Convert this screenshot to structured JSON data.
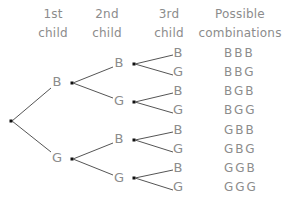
{
  "headers": [
    {
      "line1": "1st",
      "line2": "child",
      "cx": 53
    },
    {
      "line1": "2nd",
      "line2": "child",
      "cx": 107
    },
    {
      "line1": "3rd",
      "line2": "child",
      "cx": 169
    },
    {
      "line1": "Possible",
      "line2": "combinations",
      "cx": 240
    }
  ],
  "colors": {
    "line": "#555555",
    "text": "#8c8c8c",
    "dot": "#111111"
  },
  "root": {
    "x": 11,
    "y": 121
  },
  "level1": [
    {
      "label": "B",
      "lx": 57,
      "ly": 82,
      "dot": {
        "x": 72,
        "y": 83
      }
    },
    {
      "label": "G",
      "lx": 57,
      "ly": 158,
      "dot": {
        "x": 72,
        "y": 159
      }
    }
  ],
  "level2": [
    {
      "label": "B",
      "lx": 119,
      "ly": 63,
      "dot": {
        "x": 134,
        "y": 64
      },
      "parent": 0
    },
    {
      "label": "G",
      "lx": 119,
      "ly": 101,
      "dot": {
        "x": 134,
        "y": 102
      },
      "parent": 0
    },
    {
      "label": "B",
      "lx": 119,
      "ly": 139,
      "dot": {
        "x": 134,
        "y": 140
      },
      "parent": 1
    },
    {
      "label": "G",
      "lx": 119,
      "ly": 178,
      "dot": {
        "x": 134,
        "y": 178
      },
      "parent": 1
    }
  ],
  "level3": [
    {
      "label": "B",
      "lx": 178,
      "ly": 53,
      "parent": 0
    },
    {
      "label": "G",
      "lx": 178,
      "ly": 72,
      "parent": 0
    },
    {
      "label": "B",
      "lx": 178,
      "ly": 91,
      "parent": 1
    },
    {
      "label": "G",
      "lx": 178,
      "ly": 110,
      "parent": 1
    },
    {
      "label": "B",
      "lx": 178,
      "ly": 130,
      "parent": 2
    },
    {
      "label": "G",
      "lx": 178,
      "ly": 149,
      "parent": 2
    },
    {
      "label": "B",
      "lx": 178,
      "ly": 168,
      "parent": 3
    },
    {
      "label": "G",
      "lx": 178,
      "ly": 187,
      "parent": 3
    }
  ],
  "combinations": [
    {
      "text": "BBB",
      "y": 53
    },
    {
      "text": "BBG",
      "y": 72
    },
    {
      "text": "BGB",
      "y": 91
    },
    {
      "text": "BGG",
      "y": 110
    },
    {
      "text": "GBB",
      "y": 130
    },
    {
      "text": "GBG",
      "y": 149
    },
    {
      "text": "GGB",
      "y": 168
    },
    {
      "text": "GGG",
      "y": 187
    }
  ],
  "combo_x": 224
}
